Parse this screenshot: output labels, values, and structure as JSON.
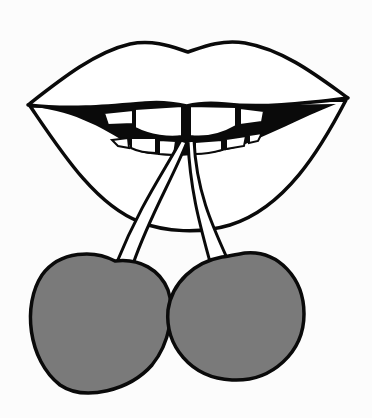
{
  "illustration": {
    "title": "Lips biting cherry stems",
    "colors": {
      "background": "#fcfcfc",
      "outline": "#0a0a0a",
      "lips_fill": "#ffffff",
      "mouth_interior": "#0a0a0a",
      "teeth": "#ffffff",
      "cherry_fill": "#7a7a7a"
    },
    "elements": [
      "upper-lip",
      "lower-lip",
      "teeth",
      "left-stem",
      "right-stem",
      "left-cherry",
      "right-cherry"
    ]
  }
}
